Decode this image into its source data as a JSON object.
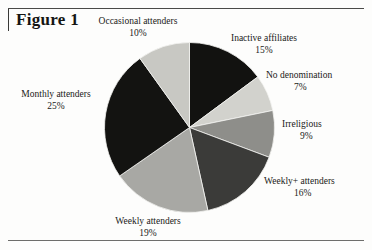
{
  "figure": {
    "label": "Figure 1"
  },
  "chart_data": {
    "type": "pie",
    "title": "Figure 1",
    "units": "percent",
    "start_angle_deg": 0,
    "direction": "clockwise",
    "legend": "none",
    "labels_position": "outside-callout",
    "total_percent": 101,
    "slices": [
      {
        "label": "Inactive affiliates",
        "value": 15,
        "pct_text": "15%",
        "color": "#121210"
      },
      {
        "label": "No denomination",
        "value": 7,
        "pct_text": "7%",
        "color": "#d2d2cd"
      },
      {
        "label": "Irreligious",
        "value": 9,
        "pct_text": "9%",
        "color": "#8e8e8a"
      },
      {
        "label": "Weekly+ attenders",
        "value": 16,
        "pct_text": "16%",
        "color": "#3b3b39"
      },
      {
        "label": "Weekly attenders",
        "value": 19,
        "pct_text": "19%",
        "color": "#a8a8a4"
      },
      {
        "label": "Monthly attenders",
        "value": 25,
        "pct_text": "25%",
        "color": "#131311"
      },
      {
        "label": "Occasional attenders",
        "value": 10,
        "pct_text": "10%",
        "color": "#c8c8c3"
      }
    ],
    "categories": [
      "Inactive affiliates",
      "No denomination",
      "Irreligious",
      "Weekly+ attenders",
      "Weekly attenders",
      "Monthly attenders",
      "Occasional attenders"
    ],
    "values": [
      15,
      7,
      9,
      16,
      19,
      25,
      10
    ]
  }
}
